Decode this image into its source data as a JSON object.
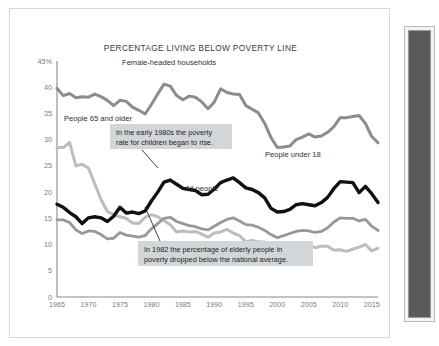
{
  "figure": {
    "title": "PERCENTAGE LIVING BELOW POVERTY LINE"
  },
  "side_panel": {
    "name": "dark-side-panel",
    "fill_color": "#5a5a5a",
    "frame_color": "#f4f4f4"
  },
  "callouts": [
    {
      "id": "callout-children",
      "line1": "In the early 1980s the poverty",
      "line2": "rate for children began to rise.",
      "box": {
        "x": 100,
        "y": 115,
        "w": 122,
        "h": 25
      },
      "leader": {
        "x1": 132,
        "y1": 141,
        "x2": 148,
        "y2": 159
      },
      "bg": "#d3d6d8"
    },
    {
      "id": "callout-elderly",
      "line1": "In 1982 the percentage of elderly people in",
      "line2": "poverty dropped below the national average.",
      "box": {
        "x": 128,
        "y": 232,
        "w": 175,
        "h": 25
      },
      "leader": {
        "x1": 150,
        "y1": 232,
        "x2": 135,
        "y2": 198
      },
      "bg": "#d3d6d8"
    }
  ],
  "series_labels": [
    {
      "id": "label-female-headed",
      "text": "Female-headed households",
      "x": 112,
      "y": 56
    },
    {
      "id": "label-65-older",
      "text": "People 65 and older",
      "x": 54,
      "y": 112
    },
    {
      "id": "label-under-18",
      "text": "People under 18",
      "x": 255,
      "y": 148
    },
    {
      "id": "label-all-people",
      "text": "All people",
      "x": 175,
      "y": 182
    }
  ],
  "chart_data": {
    "type": "line",
    "title": "PERCENTAGE LIVING BELOW POVERTY LINE",
    "xlabel": "",
    "ylabel": "",
    "xlim": [
      1965,
      2016
    ],
    "ylim": [
      0,
      45
    ],
    "grid": false,
    "legend": "inline-labels",
    "ytick_labels": [
      "45%",
      "40",
      "35",
      "30",
      "25",
      "20",
      "15",
      "10",
      "5",
      "0"
    ],
    "ytick_values": [
      45,
      40,
      35,
      30,
      25,
      20,
      15,
      10,
      5,
      0
    ],
    "xtick_labels": [
      "1965",
      "1970",
      "1975",
      "1980",
      "1985",
      "1990",
      "1995",
      "2000",
      "2005",
      "2010",
      "2015"
    ],
    "xtick_values": [
      1965,
      1970,
      1975,
      1980,
      1985,
      1990,
      1995,
      2000,
      2005,
      2010,
      2015
    ],
    "x": [
      1965,
      1966,
      1967,
      1968,
      1969,
      1970,
      1971,
      1972,
      1973,
      1974,
      1975,
      1976,
      1977,
      1978,
      1979,
      1980,
      1981,
      1982,
      1983,
      1984,
      1985,
      1986,
      1987,
      1988,
      1989,
      1990,
      1991,
      1992,
      1993,
      1994,
      1995,
      1996,
      1997,
      1998,
      1999,
      2000,
      2001,
      2002,
      2003,
      2004,
      2005,
      2006,
      2007,
      2008,
      2009,
      2010,
      2011,
      2012,
      2013,
      2014,
      2015,
      2016
    ],
    "series": [
      {
        "name": "Female-headed households",
        "color": "#8c8c8c",
        "width": 3.0,
        "values": [
          39.8,
          38.4,
          38.8,
          38.0,
          38.2,
          38.1,
          38.7,
          38.2,
          37.5,
          36.5,
          37.5,
          37.3,
          36.2,
          35.6,
          34.9,
          36.7,
          38.7,
          40.6,
          40.2,
          38.4,
          37.6,
          38.3,
          38.1,
          37.2,
          35.9,
          37.2,
          39.7,
          39.0,
          38.7,
          38.6,
          36.5,
          35.8,
          35.1,
          33.1,
          30.4,
          28.5,
          28.6,
          28.8,
          30.0,
          30.5,
          31.1,
          30.5,
          30.7,
          31.4,
          32.5,
          34.2,
          34.2,
          34.4,
          34.6,
          33.1,
          30.6,
          29.4
        ]
      },
      {
        "name": "People 65 and older",
        "color": "#bdbdbd",
        "width": 3.0,
        "values": [
          28.5,
          28.5,
          29.5,
          25.0,
          25.3,
          24.6,
          21.6,
          18.6,
          16.3,
          15.7,
          15.3,
          15.0,
          14.1,
          14.0,
          15.2,
          15.7,
          15.3,
          14.6,
          13.8,
          12.4,
          12.6,
          12.4,
          12.5,
          12.0,
          11.4,
          12.2,
          12.4,
          12.9,
          12.2,
          11.7,
          10.5,
          10.8,
          10.5,
          10.5,
          9.7,
          9.9,
          10.1,
          10.4,
          10.2,
          9.8,
          10.1,
          9.4,
          9.7,
          9.7,
          8.9,
          9.0,
          8.7,
          9.1,
          9.5,
          10.0,
          8.8,
          9.3
        ]
      },
      {
        "name": "People under 18",
        "color": "#101010",
        "width": 3.4,
        "values": [
          17.7,
          17.1,
          16.1,
          15.3,
          14.0,
          15.1,
          15.3,
          15.1,
          14.4,
          15.4,
          17.1,
          16.0,
          16.2,
          15.9,
          16.4,
          18.3,
          20.0,
          21.9,
          22.3,
          21.5,
          20.7,
          20.5,
          20.3,
          19.5,
          19.6,
          20.6,
          21.8,
          22.3,
          22.7,
          21.8,
          20.8,
          20.5,
          19.9,
          18.9,
          16.9,
          16.2,
          16.3,
          16.7,
          17.6,
          17.8,
          17.6,
          17.4,
          18.0,
          19.0,
          20.7,
          22.0,
          21.9,
          21.8,
          19.9,
          21.1,
          19.7,
          18.0
        ]
      },
      {
        "name": "All people",
        "color": "#989898",
        "width": 2.8,
        "values": [
          14.7,
          14.7,
          14.2,
          12.8,
          12.1,
          12.6,
          12.5,
          11.9,
          11.1,
          11.2,
          12.3,
          11.8,
          11.6,
          11.4,
          11.7,
          13.0,
          14.0,
          15.0,
          15.2,
          14.4,
          14.0,
          13.6,
          13.4,
          13.0,
          12.8,
          13.5,
          14.2,
          14.8,
          15.1,
          14.5,
          13.8,
          13.7,
          13.3,
          12.7,
          11.9,
          11.3,
          11.7,
          12.1,
          12.5,
          12.7,
          12.6,
          12.3,
          12.5,
          13.2,
          14.3,
          15.1,
          15.0,
          15.0,
          14.5,
          14.8,
          13.5,
          12.7
        ]
      }
    ]
  }
}
